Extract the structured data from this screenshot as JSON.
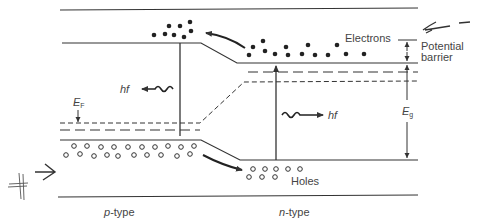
{
  "diagram": {
    "labels": {
      "electrons": "Electrons",
      "holes": "Holes",
      "potential_barrier_line1": "Potential",
      "potential_barrier_line2": "barrier",
      "photon_left": "hf",
      "photon_right": "hf",
      "fermi_level": "E",
      "fermi_level_sub": "F",
      "band_gap": "E",
      "band_gap_sub": "g",
      "p_type_prefix": "p",
      "p_type_suffix": "-type",
      "n_type_prefix": "n",
      "n_type_suffix": "-type"
    },
    "colors": {
      "line": "#333333",
      "text": "#444444",
      "background": "#ffffff"
    },
    "regions": [
      "p-type",
      "n-type"
    ],
    "carriers": {
      "electrons_p_side_count": 9,
      "electrons_n_side_count": 14,
      "holes_p_side_count": 21,
      "holes_n_side_count": 8
    }
  }
}
